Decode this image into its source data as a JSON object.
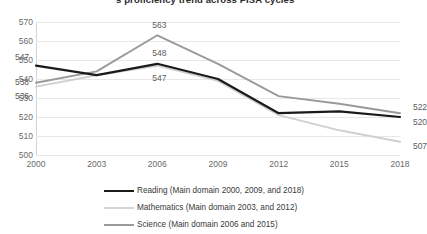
{
  "chart_data": {
    "type": "line",
    "title": "'s proficiency trend across PISA cycles",
    "xlabel": "",
    "ylabel": "",
    "categories": [
      "2000",
      "2003",
      "2006",
      "2009",
      "2012",
      "2015",
      "2018"
    ],
    "x": [
      2000,
      2003,
      2006,
      2009,
      2012,
      2015,
      2018
    ],
    "ylim": [
      500,
      570
    ],
    "yticks": [
      500,
      510,
      520,
      530,
      540,
      550,
      560,
      570
    ],
    "grid": true,
    "legend_position": "bottom",
    "series": [
      {
        "name": "Reading (Main domain 2000, 2009, and 2018)",
        "short_name": "Reading",
        "color": "#1a1a1a",
        "values": [
          547,
          542,
          548,
          540,
          522,
          523,
          520
        ],
        "labels": [
          {
            "x": "2000",
            "value": 547,
            "text": "547"
          },
          {
            "x": "2006",
            "value": 548,
            "text": "548"
          },
          {
            "x": "2018",
            "value": 520,
            "text": "520"
          }
        ]
      },
      {
        "name": "Mathematics (Main domain 2003, and 2012)",
        "short_name": "Mathematics",
        "color": "#d0d0d0",
        "values": [
          536,
          542,
          547,
          539,
          521,
          513,
          507
        ],
        "labels": [
          {
            "x": "2000",
            "value": 536,
            "text": "536"
          },
          {
            "x": "2006",
            "value": 547,
            "text": "547"
          },
          {
            "x": "2018",
            "value": 507,
            "text": "507"
          }
        ]
      },
      {
        "name": "Science (Main domain 2006 and 2015)",
        "short_name": "Science",
        "color": "#9a9a9a",
        "values": [
          538,
          544,
          563,
          548,
          531,
          527,
          522
        ],
        "labels": [
          {
            "x": "2000",
            "value": 538,
            "text": "538"
          },
          {
            "x": "2006",
            "value": 563,
            "text": "563"
          },
          {
            "x": "2018",
            "value": 522,
            "text": "522"
          }
        ]
      }
    ]
  },
  "legend": {
    "items": [
      {
        "label": "Reading (Main domain 2000, 2009, and 2018)",
        "color": "#1a1a1a",
        "thickness": 2.4
      },
      {
        "label": "Mathematics (Main domain 2003, and 2012)",
        "color": "#d4d4d4",
        "thickness": 2.0
      },
      {
        "label": "Science (Main domain 2006 and 2015)",
        "color": "#9a9a9a",
        "thickness": 2.0
      }
    ]
  }
}
